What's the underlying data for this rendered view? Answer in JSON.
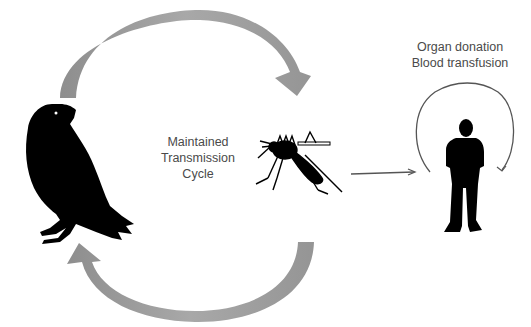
{
  "diagram": {
    "cycle_label": {
      "line1": "Maintained",
      "line2": "Transmission",
      "line3": "Cycle"
    },
    "host_label": {
      "line1": "Organ donation",
      "line2": "Blood transfusion"
    },
    "nodes": [
      {
        "id": "bird",
        "icon": "bird-silhouette-icon"
      },
      {
        "id": "mosquito",
        "icon": "mosquito-silhouette-icon"
      },
      {
        "id": "human",
        "icon": "human-silhouette-icon"
      }
    ],
    "colors": {
      "cycle_arrow": "#9a9a9a",
      "silhouette": "#000000",
      "text": "#4a4a4a",
      "line": "#555555"
    }
  }
}
